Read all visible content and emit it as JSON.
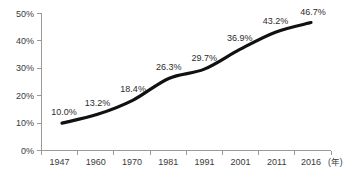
{
  "chart_data": {
    "type": "line",
    "title": "",
    "xlabel": "年",
    "ylabel": "",
    "categories": [
      "1947",
      "1960",
      "1970",
      "1981",
      "1991",
      "2001",
      "2011",
      "2016"
    ],
    "values": [
      10.0,
      13.2,
      18.4,
      26.3,
      29.7,
      36.9,
      43.2,
      46.7
    ],
    "point_labels": [
      "10.0%",
      "13.2%",
      "18.4%",
      "26.3%",
      "29.7%",
      "36.9%",
      "43.2%",
      "46.7%"
    ],
    "ylim": [
      0,
      50
    ],
    "y_ticks": [
      0,
      10,
      20,
      30,
      40,
      50
    ],
    "y_tick_labels": [
      "0%",
      "10%",
      "20%",
      "30%",
      "40%",
      "50%"
    ],
    "x_tick_labels": [
      "1947",
      "1960",
      "1970",
      "1981",
      "1991",
      "2001",
      "2011",
      "2016"
    ],
    "x_unit_label": "(年)",
    "grid": false,
    "legend": null,
    "series": [
      {
        "name": "",
        "values": [
          10.0,
          13.2,
          18.4,
          26.3,
          29.7,
          36.9,
          43.2,
          46.7
        ]
      }
    ],
    "colors": {
      "line": "#111111",
      "axis": "#9a9a9a",
      "text": "#3a3a3a",
      "background": "#ffffff"
    }
  }
}
